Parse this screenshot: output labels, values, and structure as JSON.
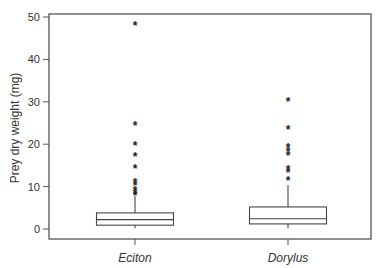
{
  "chart_data": {
    "type": "box",
    "title": "",
    "xlabel": "",
    "ylabel": "Prey dry weight (mg)",
    "ylim": [
      -2.3,
      52.4
    ],
    "yticks": [
      0,
      10,
      20,
      30,
      40,
      50
    ],
    "grid": false,
    "legend": null,
    "categories": [
      "Eciton",
      "Dorylus"
    ],
    "series": [
      {
        "name": "Eciton",
        "whisker_low": 0.2,
        "q1": 0.9,
        "median": 2.2,
        "q3": 3.8,
        "whisker_high": 7.8,
        "outliers": [
          48.1,
          24.5,
          19.8,
          17.3,
          14.3,
          11.2,
          10.3,
          9.1,
          8.5,
          8.0
        ]
      },
      {
        "name": "Dorylus",
        "whisker_low": 0.2,
        "q1": 1.2,
        "median": 2.4,
        "q3": 5.2,
        "whisker_high": 10.4,
        "outliers": [
          30.2,
          23.6,
          19.3,
          18.4,
          17.5,
          14.2,
          13.5,
          11.6
        ]
      }
    ]
  },
  "axis": {
    "y_title": "Prey dry weight (mg)",
    "y_tick_labels": [
      "0",
      "10",
      "20",
      "30",
      "40",
      "50"
    ],
    "x_tick_labels": [
      "Eciton",
      "Dorylus"
    ]
  },
  "style": {
    "axis_color": "#555555",
    "box_color": "#444444",
    "outlier_color": "#222222",
    "outlier_glyph": "*"
  }
}
